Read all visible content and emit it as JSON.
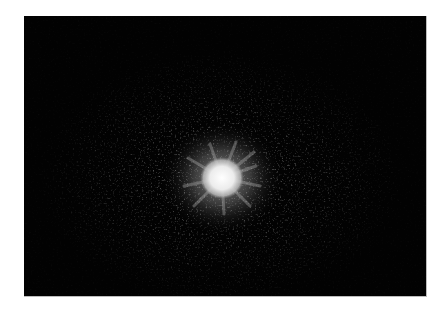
{
  "image": {
    "description": "Grayscale diffraction / starburst pattern: bright white central spot with radial speckle halo on black background",
    "background_color": "#020202",
    "page_color": "#ffffff",
    "center": {
      "x": 198,
      "y": 162
    },
    "core_color": "#f2f2f2",
    "halo_color": "#9a9a9a"
  }
}
